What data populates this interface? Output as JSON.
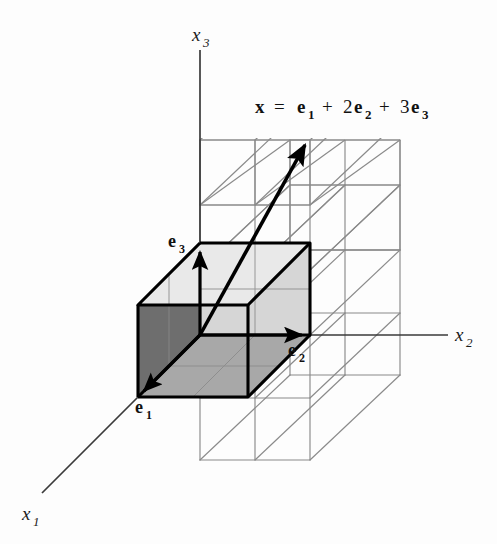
{
  "figure": {
    "equation": {
      "vector": "x",
      "equals": "=",
      "term1_coeff": "",
      "term1_base": "e",
      "term1_sub": "1",
      "plus1": "+",
      "term2_coeff": "2",
      "term2_base": "e",
      "term2_sub": "2",
      "plus2": "+",
      "term3_coeff": "3",
      "term3_base": "e",
      "term3_sub": "3",
      "full_text": "x = e1 + 2e2 + 3e3"
    },
    "axes": [
      {
        "id": "x1",
        "base": "x",
        "sub": "1",
        "label": "x1"
      },
      {
        "id": "x2",
        "base": "x",
        "sub": "2",
        "label": "x2"
      },
      {
        "id": "x3",
        "base": "x",
        "sub": "3",
        "label": "x3"
      }
    ],
    "basis_vectors": [
      {
        "id": "e1",
        "base": "e",
        "sub": "1",
        "label": "e1"
      },
      {
        "id": "e2",
        "base": "e",
        "sub": "2",
        "label": "e2"
      },
      {
        "id": "e3",
        "base": "e",
        "sub": "3",
        "label": "e3"
      }
    ],
    "colors": {
      "background": "#fdfdfd",
      "line": "#3a3a3a",
      "bold_line": "#000000",
      "grid_line": "#8a8a8a",
      "face_dark": "#6e6e6e",
      "face_medium": "#a8a8a8",
      "face_light": "#d6d6d6",
      "text": "#111111"
    },
    "geometry": {
      "origin": {
        "x": 200,
        "y": 335
      },
      "unit_e2": {
        "x": 110,
        "y": 0
      },
      "unit_e3": {
        "x": 0,
        "y": -92
      },
      "unit_e1": {
        "x": -62,
        "y": 62
      },
      "grid_counts": {
        "along_x2": 2,
        "along_x3": 3,
        "along_x1": 1
      },
      "vector_tip": {
        "x": 307,
        "y": 138
      }
    }
  }
}
